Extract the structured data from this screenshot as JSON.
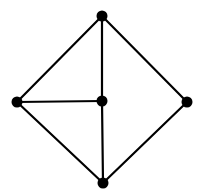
{
  "diagram": {
    "type": "undirected-graph",
    "colors": {
      "background": "#ffffff",
      "edge": "#000000",
      "node": "#000000"
    },
    "node_radius": 5.5,
    "nodes": [
      {
        "id": "top",
        "x": 102,
        "y": 16
      },
      {
        "id": "left",
        "x": 17,
        "y": 102
      },
      {
        "id": "center",
        "x": 102,
        "y": 101
      },
      {
        "id": "right",
        "x": 187,
        "y": 102
      },
      {
        "id": "bottom",
        "x": 103,
        "y": 183
      }
    ],
    "edges": [
      {
        "from": "top",
        "to": "left"
      },
      {
        "from": "top",
        "to": "right"
      },
      {
        "from": "top",
        "to": "center"
      },
      {
        "from": "left",
        "to": "center"
      },
      {
        "from": "left",
        "to": "bottom"
      },
      {
        "from": "center",
        "to": "bottom"
      },
      {
        "from": "right",
        "to": "bottom"
      }
    ]
  }
}
